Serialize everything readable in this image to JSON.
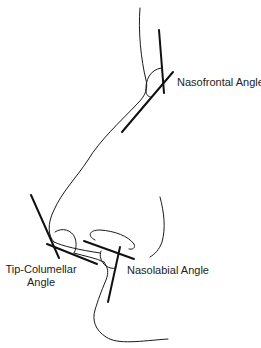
{
  "diagram": {
    "type": "nasal profile angle diagram",
    "labels": {
      "nasofrontal": "Nasofrontal Angle",
      "tip_columellar_line1": "Tip-Columellar",
      "tip_columellar_line2": "Angle",
      "nasolabial": "Nasolabial Angle"
    },
    "colors": {
      "line": "#111111",
      "text": "#222222",
      "background": "#ffffff"
    }
  }
}
